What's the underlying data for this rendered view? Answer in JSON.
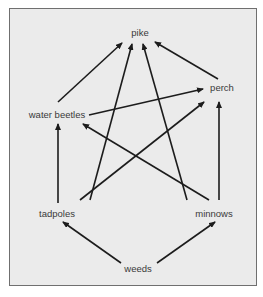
{
  "diagram": {
    "type": "food-web",
    "colors": {
      "background": "#ebebeb",
      "border": "#6f6f6f",
      "arrow": "#1c1c1c",
      "label": "#3a3a3a"
    },
    "nodes": [
      {
        "id": "pike",
        "label": "pike",
        "x": 140,
        "y": 33
      },
      {
        "id": "perch",
        "label": "perch",
        "x": 222,
        "y": 88
      },
      {
        "id": "water_beetles",
        "label": "water beetles",
        "x": 57,
        "y": 115
      },
      {
        "id": "tadpoles",
        "label": "tadpoles",
        "x": 57,
        "y": 214
      },
      {
        "id": "minnows",
        "label": "minnows",
        "x": 214,
        "y": 214
      },
      {
        "id": "weeds",
        "label": "weeds",
        "x": 138,
        "y": 269
      }
    ],
    "edges": [
      {
        "from": "water_beetles",
        "to": "pike",
        "x1": 58,
        "y1": 102,
        "x2": 122,
        "y2": 43
      },
      {
        "from": "tadpoles",
        "to": "pike",
        "x1": 90,
        "y1": 200,
        "x2": 132,
        "y2": 44
      },
      {
        "from": "minnows",
        "to": "pike",
        "x1": 187,
        "y1": 200,
        "x2": 143,
        "y2": 44
      },
      {
        "from": "perch",
        "to": "pike",
        "x1": 218,
        "y1": 79,
        "x2": 155,
        "y2": 42
      },
      {
        "from": "water_beetles",
        "to": "perch",
        "x1": 89,
        "y1": 115,
        "x2": 203,
        "y2": 89
      },
      {
        "from": "tadpoles",
        "to": "water_beetles",
        "x1": 58,
        "y1": 203,
        "x2": 58,
        "y2": 124
      },
      {
        "from": "tadpoles",
        "to": "perch",
        "x1": 80,
        "y1": 200,
        "x2": 204,
        "y2": 102
      },
      {
        "from": "minnows",
        "to": "water_beetles",
        "x1": 209,
        "y1": 200,
        "x2": 83,
        "y2": 124
      },
      {
        "from": "minnows",
        "to": "perch",
        "x1": 219,
        "y1": 200,
        "x2": 219,
        "y2": 102
      },
      {
        "from": "weeds",
        "to": "tadpoles",
        "x1": 121,
        "y1": 263,
        "x2": 63,
        "y2": 222
      },
      {
        "from": "weeds",
        "to": "minnows",
        "x1": 157,
        "y1": 263,
        "x2": 215,
        "y2": 222
      }
    ]
  }
}
